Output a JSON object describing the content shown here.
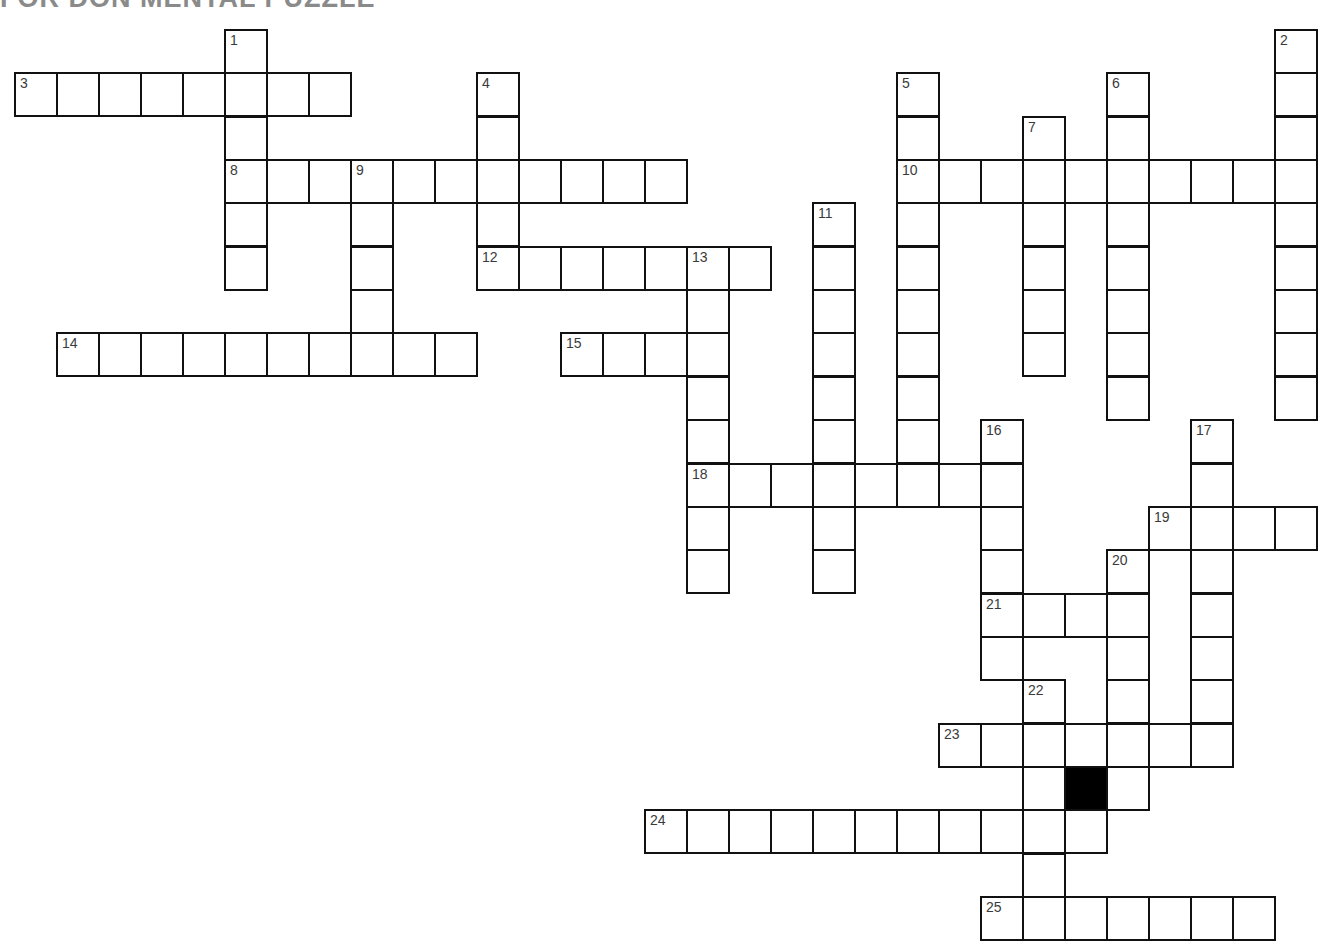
{
  "title": "FOR DON MENTAL PUZZLE",
  "grid": {
    "origin_x": 14,
    "origin_y": 29,
    "cell_w": 42,
    "cell_h": 43.35,
    "columns": 31,
    "rows": 21,
    "border_color": "#111111",
    "number_color": "#3a3a3a",
    "black_cells": [
      {
        "row": 17,
        "col": 25
      }
    ]
  },
  "across": [
    {
      "number": "3",
      "row": 1,
      "col": 0,
      "length": 8
    },
    {
      "number": "8",
      "row": 3,
      "col": 5,
      "length": 11
    },
    {
      "number": "10",
      "row": 3,
      "col": 21,
      "length": 10
    },
    {
      "number": "12",
      "row": 5,
      "col": 11,
      "length": 7
    },
    {
      "number": "14",
      "row": 7,
      "col": 1,
      "length": 10
    },
    {
      "number": "15",
      "row": 7,
      "col": 13,
      "length": 4
    },
    {
      "number": "18",
      "row": 10,
      "col": 16,
      "length": 8
    },
    {
      "number": "19",
      "row": 11,
      "col": 27,
      "length": 4
    },
    {
      "number": "21",
      "row": 13,
      "col": 23,
      "length": 4
    },
    {
      "number": "23",
      "row": 16,
      "col": 22,
      "length": 7
    },
    {
      "number": "24",
      "row": 18,
      "col": 15,
      "length": 11
    },
    {
      "number": "25",
      "row": 20,
      "col": 23,
      "length": 7
    }
  ],
  "down": [
    {
      "number": "1",
      "row": 0,
      "col": 5,
      "length": 6
    },
    {
      "number": "2",
      "row": 0,
      "col": 30,
      "length": 9
    },
    {
      "number": "4",
      "row": 1,
      "col": 11,
      "length": 5
    },
    {
      "number": "5",
      "row": 1,
      "col": 21,
      "length": 10
    },
    {
      "number": "6",
      "row": 1,
      "col": 26,
      "length": 8
    },
    {
      "number": "7",
      "row": 2,
      "col": 24,
      "length": 6
    },
    {
      "number": "9",
      "row": 3,
      "col": 8,
      "length": 5
    },
    {
      "number": "11",
      "row": 4,
      "col": 19,
      "length": 9
    },
    {
      "number": "13",
      "row": 5,
      "col": 16,
      "length": 8
    },
    {
      "number": "16",
      "row": 9,
      "col": 23,
      "length": 6
    },
    {
      "number": "17",
      "row": 9,
      "col": 28,
      "length": 8
    },
    {
      "number": "20",
      "row": 12,
      "col": 26,
      "length": 6
    },
    {
      "number": "22",
      "row": 15,
      "col": 24,
      "length": 6
    }
  ]
}
